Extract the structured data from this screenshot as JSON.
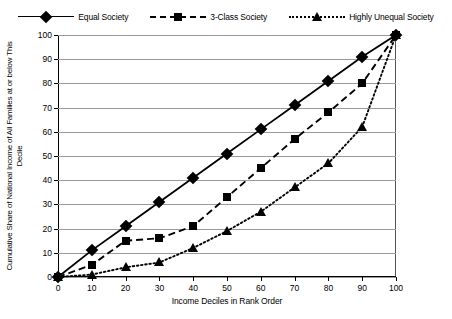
{
  "chart_data": {
    "type": "line",
    "title": "",
    "xlabel": "Income Deciles in Rank Order",
    "ylabel": "Cumulative Share of National Income of All Families at or below This Decile",
    "xlim": [
      0,
      100
    ],
    "ylim": [
      0,
      100
    ],
    "xticks": [
      0,
      10,
      20,
      30,
      40,
      50,
      60,
      70,
      80,
      90,
      100
    ],
    "yticks": [
      0,
      10,
      20,
      30,
      40,
      50,
      60,
      70,
      80,
      90,
      100
    ],
    "grid": "horizontal",
    "legend_position": "top-center",
    "x": [
      0,
      10,
      20,
      30,
      40,
      50,
      60,
      70,
      80,
      90,
      100
    ],
    "series": [
      {
        "name": "Equal Society",
        "marker": "diamond",
        "line_style": "solid",
        "color": "#000000",
        "values": [
          0,
          11,
          21,
          31,
          41,
          51,
          61,
          71,
          81,
          91,
          100
        ]
      },
      {
        "name": "3-Class Society",
        "marker": "square",
        "line_style": "dashed",
        "color": "#000000",
        "values": [
          0,
          5,
          15,
          16,
          21,
          33,
          45,
          57,
          68,
          80,
          100
        ]
      },
      {
        "name": "Highly Unequal Society",
        "marker": "triangle",
        "line_style": "dotted",
        "color": "#000000",
        "values": [
          0,
          1,
          4,
          6,
          12,
          19,
          27,
          37,
          47,
          62,
          100
        ]
      }
    ]
  },
  "legend": {
    "items": [
      {
        "label": "Equal Society",
        "marker": "diamond-marker",
        "style": "solid"
      },
      {
        "label": "3-Class Society",
        "marker": "square-marker",
        "style": "dashed"
      },
      {
        "label": "Highly Unequal Society",
        "marker": "triangle-marker",
        "style": "dotted"
      }
    ]
  },
  "axes": {
    "x_title": "Income Deciles in Rank Order",
    "y_title": "Cumulative Share of National Income of All Families at or below This Decile"
  },
  "colors": {
    "ink": "#000000",
    "grid": "#9a9a9a",
    "background": "#ffffff"
  }
}
